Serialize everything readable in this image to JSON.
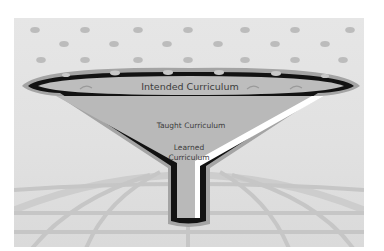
{
  "diagram": {
    "type": "funnel",
    "levels": [
      {
        "id": "intended",
        "label": "Intended Curriculum"
      },
      {
        "id": "taught",
        "label": "Taught Curriculum"
      },
      {
        "id": "learned",
        "label_lines": [
          "Learned",
          "Curriculum"
        ]
      }
    ],
    "background": {
      "top_pattern": "dots",
      "bottom_pattern": "globe-grid"
    },
    "colors": {
      "frame_bg": "#e3e3e3",
      "dot": "#bcbcbc",
      "funnel_fill": "#b9b9b9",
      "funnel_outline": "#111111",
      "funnel_rim": "#9e9e9e",
      "highlight": "#ffffff",
      "grid": "#c4c4c4",
      "text": "#3c3c3c"
    }
  }
}
